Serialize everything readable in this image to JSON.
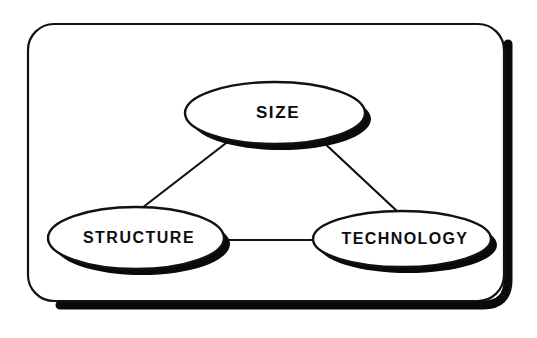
{
  "figure": {
    "background_color": "#ffffff",
    "ink_color": "#111111",
    "shadow_color": "#0a0a0a"
  },
  "frame": {
    "name": "rounded-rectangle-frame",
    "shape": "rounded-rectangle",
    "corner_radius": 26,
    "has_drop_shadow": true,
    "shadow_offset_x": 6,
    "shadow_offset_y": 6
  },
  "nodes": [
    {
      "id": "size",
      "label": "SIZE",
      "shape": "ellipse",
      "cx": 275,
      "cy": 113,
      "rx": 90,
      "ry": 31,
      "has_drop_shadow": true
    },
    {
      "id": "structure",
      "label": "STRUCTURE",
      "shape": "ellipse",
      "cx": 136,
      "cy": 238,
      "rx": 88,
      "ry": 31,
      "has_drop_shadow": true
    },
    {
      "id": "technology",
      "label": "TECHNOLOGY",
      "shape": "ellipse",
      "cx": 402,
      "cy": 239,
      "rx": 89,
      "ry": 28,
      "has_drop_shadow": true
    }
  ],
  "edges": [
    {
      "id": "size-structure",
      "from": "size",
      "to": "structure",
      "style": "solid-line",
      "arrow": "none"
    },
    {
      "id": "size-technology",
      "from": "size",
      "to": "technology",
      "style": "solid-line",
      "arrow": "none"
    },
    {
      "id": "structure-technology",
      "from": "structure",
      "to": "technology",
      "style": "solid-line",
      "arrow": "none"
    }
  ]
}
